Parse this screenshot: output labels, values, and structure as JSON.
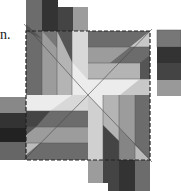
{
  "text": {
    "caption_fragment": "n."
  },
  "figure": {
    "colors": {
      "white": "#f4f4f4",
      "very_light": "#dcdcdc",
      "light": "#b4b4b4",
      "mid_light": "#9c9c9c",
      "mid": "#858585",
      "mid_dark": "#6c6c6c",
      "dark": "#4a4a4a",
      "very_dark": "#333333",
      "outline": "#222222"
    },
    "dashed_square": {
      "x": 26,
      "y": 31,
      "width": 124,
      "height": 129
    },
    "top_strip_bands": [
      "#6c6c6c",
      "#333333",
      "#444444",
      "#9c9c9c"
    ],
    "right_strip_bands": [
      "#777777",
      "#333333",
      "#444444",
      "#999999"
    ],
    "bottom_strip_bands": [
      "#9c9c9c",
      "#444444",
      "#333333",
      "#6c6c6c"
    ],
    "left_strip_bands": [
      "#888888",
      "#333333",
      "#222222",
      "#666666"
    ]
  }
}
